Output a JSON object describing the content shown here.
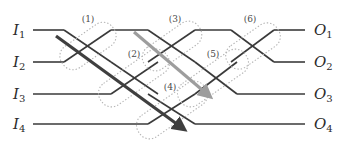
{
  "figure": {
    "width": 348,
    "height": 141,
    "background_color": "#ffffff"
  },
  "inputs": [
    {
      "id": "I1",
      "letter": "I",
      "subscript": "1",
      "label": "I1",
      "y": 30
    },
    {
      "id": "I2",
      "letter": "I",
      "subscript": "2",
      "label": "I2",
      "y": 62
    },
    {
      "id": "I3",
      "letter": "I",
      "subscript": "3",
      "label": "I3",
      "y": 94
    },
    {
      "id": "I4",
      "letter": "I",
      "subscript": "4",
      "label": "I4",
      "y": 124
    }
  ],
  "outputs": [
    {
      "id": "O1",
      "letter": "O",
      "subscript": "1",
      "label": "O1",
      "y": 30
    },
    {
      "id": "O2",
      "letter": "O",
      "subscript": "2",
      "label": "O2",
      "y": 62
    },
    {
      "id": "O3",
      "letter": "O",
      "subscript": "3",
      "label": "O3",
      "y": 94
    },
    {
      "id": "O4",
      "letter": "O",
      "subscript": "4",
      "label": "O4",
      "y": 124
    }
  ],
  "switches": [
    {
      "id": "sw1",
      "label": "(1)",
      "label_x": 88,
      "label_y": 22,
      "cx": 88,
      "cy": 46
    },
    {
      "id": "sw2",
      "label": "(2)",
      "label_x": 134,
      "label_y": 57,
      "cx": 134,
      "cy": 78
    },
    {
      "id": "sw3",
      "label": "(3)",
      "label_x": 175,
      "label_y": 22,
      "cx": 172,
      "cy": 46
    },
    {
      "id": "sw4",
      "label": "(4)",
      "label_x": 170,
      "label_y": 90,
      "cx": 172,
      "cy": 110
    },
    {
      "id": "sw5",
      "label": "(5)",
      "label_x": 213,
      "label_y": 57,
      "cx": 213,
      "cy": 78
    },
    {
      "id": "sw6",
      "label": "(6)",
      "label_x": 250,
      "label_y": 22,
      "cx": 253,
      "cy": 46
    }
  ],
  "traced_paths": [
    {
      "id": "path-dark",
      "name": "dark-highlighted-path",
      "color": "#3f3f3f",
      "from": "I1",
      "to": "I4-level",
      "start": {
        "x": 56,
        "y": 36
      },
      "end": {
        "x": 184,
        "y": 129
      }
    },
    {
      "id": "path-gray",
      "name": "gray-highlighted-path",
      "color": "#9d9d9d",
      "from": "crossing-3-top",
      "to": "O3-level",
      "start": {
        "x": 134,
        "y": 32
      },
      "end": {
        "x": 210,
        "y": 96
      }
    }
  ],
  "colors": {
    "wire": "#3a3a3a",
    "switch_outline": "#b4b4b4",
    "dark_path": "#3f3f3f",
    "gray_path": "#9d9d9d",
    "text": "#2b2b2b"
  }
}
